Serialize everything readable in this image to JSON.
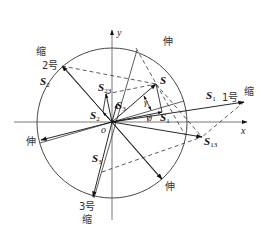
{
  "diagram": {
    "type": "vector-decomposition",
    "axes": {
      "x_label": "x",
      "y_label": "y",
      "origin_label": "o"
    },
    "circle": {
      "cx": 112,
      "cy": 123,
      "r": 75
    },
    "vectors": {
      "S": {
        "label": "S",
        "sub": ""
      },
      "S1": {
        "label": "S",
        "sub": "1"
      },
      "S2": {
        "label": "S",
        "sub": "2"
      },
      "S3": {
        "label": "S",
        "sub": "3"
      },
      "S12": {
        "label": "S",
        "sub": "12"
      },
      "S13": {
        "label": "S",
        "sub": "13"
      },
      "S23": {
        "label": "S",
        "sub": "23"
      },
      "S1_big": {
        "label": "S",
        "sub": "1"
      },
      "S2_big": {
        "label": "S",
        "sub": "2"
      }
    },
    "angles": {
      "gamma": "γ",
      "theta": "θ"
    },
    "actuators": {
      "a1": {
        "name": "1号",
        "state_out": "缩",
        "state_in": "伸"
      },
      "a2": {
        "name": "2号",
        "state_out": "缩",
        "state_in": "伸"
      },
      "a3": {
        "name": "3号",
        "state_out": "缩",
        "state_in": "伸"
      }
    },
    "labels": {
      "shrink_1": "缩",
      "shrink_2": "缩",
      "shrink_3": "缩",
      "stretch_top": "伸",
      "stretch_left": "伸",
      "stretch_bottom": "伸",
      "num_1": "1号",
      "num_2": "2号",
      "num_3": "3号"
    }
  }
}
